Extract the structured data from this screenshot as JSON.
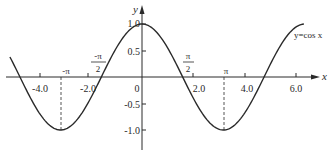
{
  "chart_data": {
    "type": "line",
    "title": "",
    "series": [
      {
        "name": "y=cos x",
        "function": "cos(x)",
        "x_range": [
          -5.1,
          6.25
        ]
      }
    ],
    "xlabel": "x",
    "ylabel": "y",
    "xlim": [
      -5.4,
      6.9
    ],
    "ylim": [
      -1.5,
      1.3
    ],
    "grid": false,
    "legend": "none",
    "x_ticks": [
      {
        "value": -4.0,
        "label": "-4.0"
      },
      {
        "value": -2.0,
        "label": "-2.0"
      },
      {
        "value": 0,
        "label": "0"
      },
      {
        "value": 2.0,
        "label": "2.0"
      },
      {
        "value": 4.0,
        "label": "4.0"
      },
      {
        "value": 6.0,
        "label": "6.0"
      }
    ],
    "y_ticks": [
      {
        "value": 1.0,
        "label": "1.0"
      },
      {
        "value": 0.5,
        "label": "0.5"
      },
      {
        "value": -0.5,
        "label": "-0.5"
      },
      {
        "value": -1.0,
        "label": "-1.0"
      }
    ],
    "annotations": [
      {
        "x": -3.14159,
        "label": "-π",
        "dashed_drop_to": -1
      },
      {
        "x": -1.5708,
        "label_num": "-π",
        "label_den": "2"
      },
      {
        "x": 1.5708,
        "label_num": "π",
        "label_den": "2"
      },
      {
        "x": 3.14159,
        "label": "π",
        "dashed_drop_to": -1
      }
    ],
    "curve_label": "y=cos x",
    "colors": {
      "curve": "#2a2a2a",
      "axes": "#2a2a2a"
    }
  },
  "labels": {
    "x_axis": "x",
    "y_axis": "y",
    "origin": "0",
    "curve": "y=cos x",
    "pi": "π",
    "neg_pi": "-π",
    "pi_half_num": "π",
    "neg_pi_half_num": "-π",
    "half_den": "2",
    "xt_m4": "-4.0",
    "xt_m2": "-2.0",
    "xt_2": "2.0",
    "xt_4": "4.0",
    "xt_6": "6.0",
    "yt_1": "1.0",
    "yt_05": "0.5",
    "yt_m05": "-0.5",
    "yt_m1": "-1.0"
  }
}
